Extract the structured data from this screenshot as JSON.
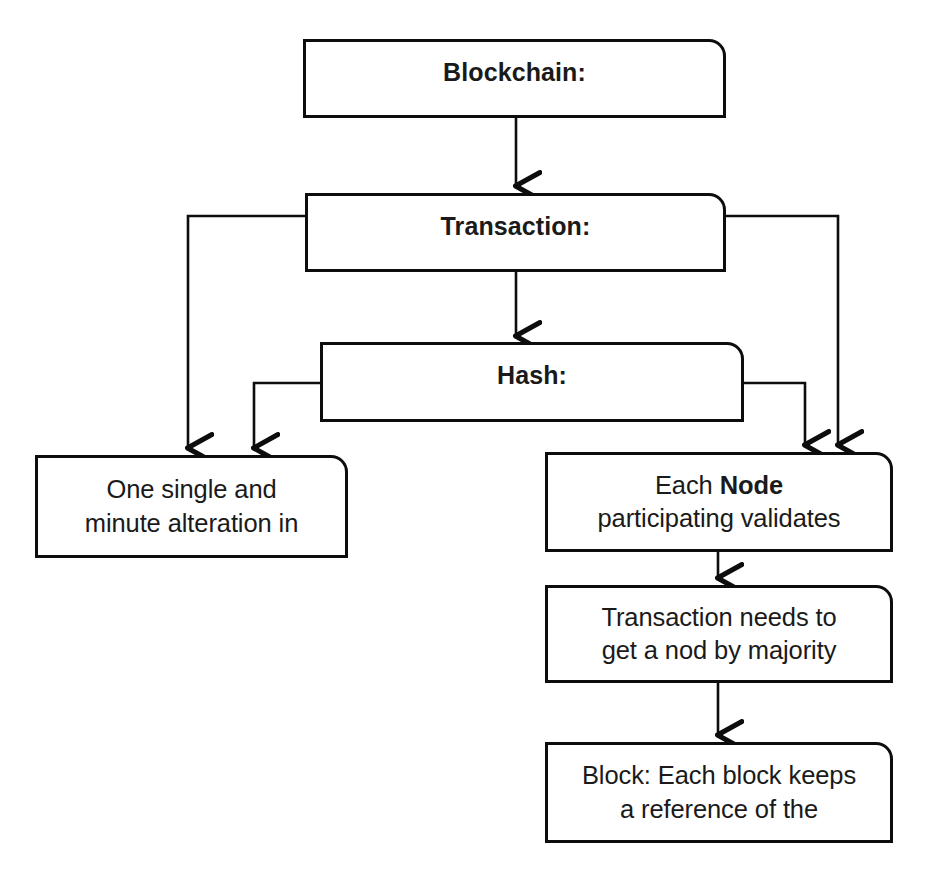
{
  "diagram": {
    "type": "flowchart",
    "background_color": "#ffffff",
    "stroke_color": "#0d0d0d",
    "text_color": "#1a1a1a",
    "nodes": [
      {
        "id": "blockchain",
        "label": "Blockchain:",
        "style": "header"
      },
      {
        "id": "transaction",
        "label": "Transaction:",
        "style": "header"
      },
      {
        "id": "hash",
        "label": "Hash:",
        "style": "header"
      },
      {
        "id": "alteration",
        "label": "One single and\nminute alteration in",
        "style": "body"
      },
      {
        "id": "node",
        "label": "Each Node\nparticipating validates",
        "style": "body",
        "bold_word": "Node"
      },
      {
        "id": "majority",
        "label": "Transaction needs to\nget a nod by majority",
        "style": "body"
      },
      {
        "id": "block",
        "label": "Block: Each block keeps\na reference of the",
        "style": "body"
      }
    ],
    "edges": [
      {
        "from": "blockchain",
        "to": "transaction",
        "kind": "straight-down"
      },
      {
        "from": "transaction",
        "to": "hash",
        "kind": "straight-down"
      },
      {
        "from": "transaction",
        "to": "alteration",
        "kind": "left-elbow"
      },
      {
        "from": "hash",
        "to": "alteration",
        "kind": "left-elbow"
      },
      {
        "from": "transaction",
        "to": "node",
        "kind": "right-elbow"
      },
      {
        "from": "hash",
        "to": "node",
        "kind": "right-elbow"
      },
      {
        "from": "node",
        "to": "majority",
        "kind": "straight-down"
      },
      {
        "from": "majority",
        "to": "block",
        "kind": "straight-down"
      }
    ]
  }
}
